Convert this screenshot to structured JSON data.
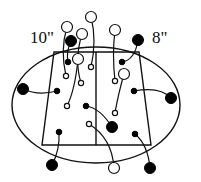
{
  "labels": {
    "left_size": "10\"",
    "right_size": "8\""
  },
  "colors": {
    "stroke": "#111111",
    "filled": "#000000",
    "hollow": "#ffffff",
    "background": "#ffffff"
  },
  "shapes": {
    "ellipse": {
      "cx": 96,
      "cy": 105,
      "rx": 84,
      "ry": 58
    },
    "trapezoid": {
      "points": [
        [
          54,
          52
        ],
        [
          139,
          52
        ],
        [
          151,
          145
        ],
        [
          42,
          145
        ]
      ]
    },
    "midline": {
      "x1": 96,
      "y1": 52,
      "x2": 96,
      "y2": 145
    }
  },
  "pairs": [
    {
      "kind": "hollow",
      "outer": [
        67,
        27
      ],
      "inner": [
        66,
        76
      ],
      "ctrl": [
        60,
        50
      ]
    },
    {
      "kind": "filled",
      "outer": [
        71,
        41
      ],
      "inner": [
        68,
        62
      ],
      "ctrl": [
        66,
        52
      ]
    },
    {
      "kind": "hollow",
      "outer": [
        82,
        34
      ],
      "inner": [
        81,
        83
      ],
      "ctrl": [
        74,
        60
      ]
    },
    {
      "kind": "hollow",
      "outer": [
        91,
        17
      ],
      "inner": [
        91,
        67
      ],
      "ctrl": [
        97,
        40
      ]
    },
    {
      "kind": "hollow",
      "outer": [
        115,
        30
      ],
      "inner": [
        115,
        81
      ],
      "ctrl": [
        112,
        55
      ]
    },
    {
      "kind": "filled",
      "outer": [
        138,
        40
      ],
      "inner": [
        122,
        62
      ],
      "ctrl": [
        135,
        60
      ]
    },
    {
      "kind": "hollow",
      "outer": [
        78,
        59
      ],
      "inner": [
        67,
        106
      ],
      "ctrl": [
        75,
        90
      ]
    },
    {
      "kind": "hollow",
      "outer": [
        124,
        74
      ],
      "inner": [
        115,
        113
      ],
      "ctrl": [
        118,
        95
      ]
    },
    {
      "kind": "filled",
      "outer": [
        23,
        89
      ],
      "inner": [
        57,
        91
      ],
      "ctrl": [
        38,
        96
      ]
    },
    {
      "kind": "filled",
      "outer": [
        171,
        98
      ],
      "inner": [
        134,
        91
      ],
      "ctrl": [
        160,
        86
      ]
    },
    {
      "kind": "filled",
      "outer": [
        112,
        127
      ],
      "inner": [
        86,
        106
      ],
      "ctrl": [
        100,
        108
      ]
    },
    {
      "kind": "hollow",
      "outer": [
        114,
        168
      ],
      "inner": [
        89,
        124
      ],
      "ctrl": [
        112,
        138
      ]
    },
    {
      "kind": "filled",
      "outer": [
        52,
        165
      ],
      "inner": [
        59,
        132
      ],
      "ctrl": [
        60,
        150
      ]
    },
    {
      "kind": "filled",
      "outer": [
        150,
        168
      ],
      "inner": [
        135,
        134
      ],
      "ctrl": [
        148,
        145
      ]
    }
  ],
  "radii": {
    "outer": 5.5,
    "inner_filled": 2.8,
    "inner_hollow": 2.6
  }
}
